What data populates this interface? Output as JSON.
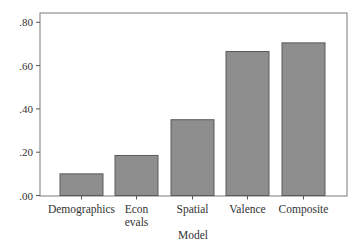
{
  "chart_data": {
    "type": "bar",
    "title": "",
    "xlabel": "Model",
    "ylabel": "",
    "categories": [
      "Demographics",
      "Econ evals",
      "Spatial",
      "Valence",
      "Composite"
    ],
    "category_lines": [
      [
        "Demographics"
      ],
      [
        "Econ",
        "evals"
      ],
      [
        "Spatial"
      ],
      [
        "Valence"
      ],
      [
        "Composite"
      ]
    ],
    "values": [
      0.1,
      0.185,
      0.35,
      0.665,
      0.705
    ],
    "ylim": [
      0,
      0.84
    ],
    "yticks": [
      0.0,
      0.2,
      0.4,
      0.6,
      0.8
    ],
    "ytick_labels": [
      ".00",
      ".20",
      ".40",
      ".60",
      ".80"
    ],
    "grid": false,
    "legend": null,
    "colors": {
      "bar_fill": "#8e8e8e",
      "bar_stroke": "#5a5a5a",
      "axis": "#555555"
    }
  }
}
